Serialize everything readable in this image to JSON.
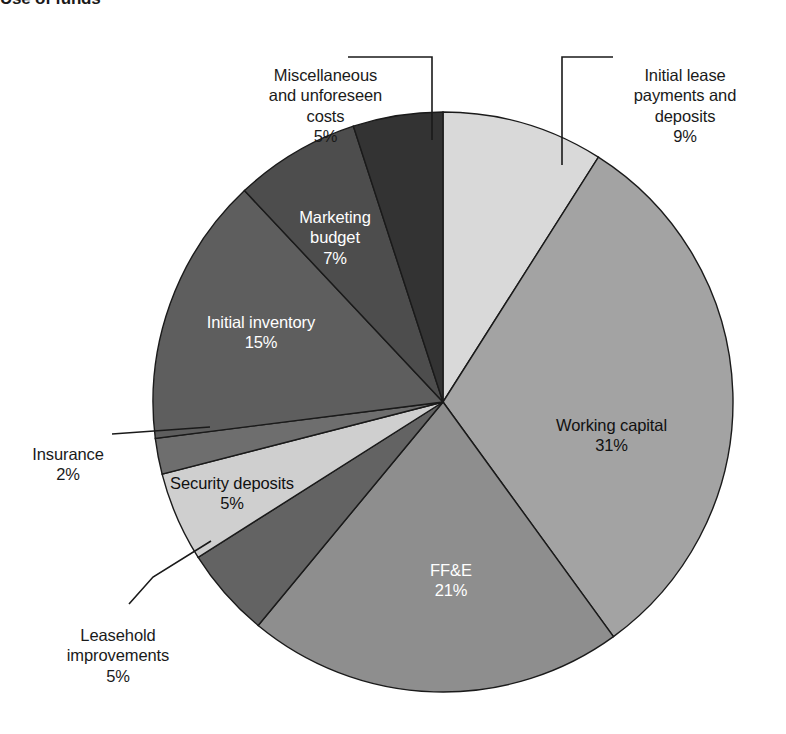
{
  "title": "Use of funds",
  "chart_data": {
    "type": "pie",
    "title": "Use of funds",
    "xlabel": "",
    "ylabel": "",
    "legend": "none",
    "grid": false,
    "units": "percent",
    "total": 100,
    "start_angle_deg": 0,
    "direction": "clockwise",
    "categories": [
      "Initial lease payments and deposits",
      "Working capital",
      "FF&E",
      "Leasehold improvements",
      "Security deposits",
      "Insurance",
      "Initial inventory",
      "Marketing budget",
      "Miscellaneous and unforeseen costs"
    ],
    "values": [
      9,
      31,
      21,
      5,
      5,
      2,
      15,
      7,
      5
    ],
    "colors": [
      "#d9d9d9",
      "#a3a3a3",
      "#8e8e8e",
      "#636363",
      "#cfcfcf",
      "#6e6e6e",
      "#5e5e5e",
      "#4d4d4d",
      "#333333"
    ]
  },
  "slices": [
    {
      "id": "initial-lease",
      "label": "Initial lease\npayments and\ndeposits",
      "percent": "9%",
      "value": 9,
      "color": "#d9d9d9",
      "placement": "outside",
      "text_color": "black"
    },
    {
      "id": "working-capital",
      "label": "Working capital",
      "percent": "31%",
      "value": 31,
      "color": "#a3a3a3",
      "placement": "inside",
      "text_color": "black"
    },
    {
      "id": "ffe",
      "label": "FF&E",
      "percent": "21%",
      "value": 21,
      "color": "#8e8e8e",
      "placement": "inside",
      "text_color": "white"
    },
    {
      "id": "leasehold-improvements",
      "label": "Leasehold\nimprovements",
      "percent": "5%",
      "value": 5,
      "color": "#636363",
      "placement": "outside",
      "text_color": "black"
    },
    {
      "id": "security-deposits",
      "label": "Security deposits",
      "percent": "5%",
      "value": 5,
      "color": "#cfcfcf",
      "placement": "inside",
      "text_color": "black"
    },
    {
      "id": "insurance",
      "label": "Insurance",
      "percent": "2%",
      "value": 2,
      "color": "#6e6e6e",
      "placement": "outside",
      "text_color": "black"
    },
    {
      "id": "initial-inventory",
      "label": "Initial inventory",
      "percent": "15%",
      "value": 15,
      "color": "#5e5e5e",
      "placement": "inside",
      "text_color": "white"
    },
    {
      "id": "marketing-budget",
      "label": "Marketing\nbudget",
      "percent": "7%",
      "value": 7,
      "color": "#4d4d4d",
      "placement": "inside",
      "text_color": "white"
    },
    {
      "id": "miscellaneous",
      "label": "Miscellaneous\nand unforeseen\ncosts",
      "percent": "5%",
      "value": 5,
      "color": "#333333",
      "placement": "outside",
      "text_color": "black"
    }
  ],
  "geometry": {
    "center_x": 443,
    "center_y": 402,
    "radius": 290
  }
}
